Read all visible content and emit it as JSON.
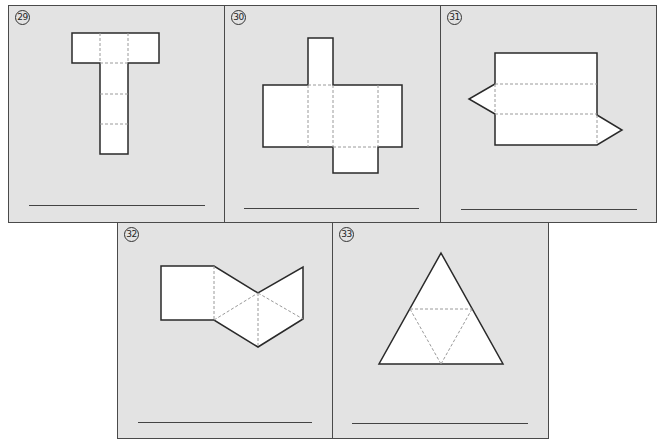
{
  "worksheet": {
    "panels": [
      {
        "number": "29",
        "shape_net": "t-shaped-rectangular-prism-net",
        "answer": ""
      },
      {
        "number": "30",
        "shape_net": "cross-rectangular-prism-net",
        "answer": ""
      },
      {
        "number": "31",
        "shape_net": "triangular-prism-net",
        "answer": ""
      },
      {
        "number": "32",
        "shape_net": "square-pyramid-net",
        "answer": ""
      },
      {
        "number": "33",
        "shape_net": "triangular-pyramid-net",
        "answer": ""
      }
    ]
  },
  "colors": {
    "panel_bg": "#e3e3e3",
    "panel_border": "#4a4a4a",
    "net_fill": "#ffffff",
    "net_outline": "#2a2a2a",
    "fold_line": "#9a9a9a"
  }
}
